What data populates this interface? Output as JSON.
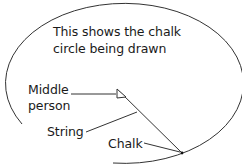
{
  "title": {
    "line1": "This shows the chalk",
    "line2": "circle being drawn"
  },
  "labels": {
    "middle_person_line1": "Middle",
    "middle_person_line2": "person",
    "string": "String",
    "chalk": "Chalk"
  },
  "colors": {
    "stroke": "#333333",
    "text": "#1a1a1a",
    "background": "#ffffff"
  }
}
